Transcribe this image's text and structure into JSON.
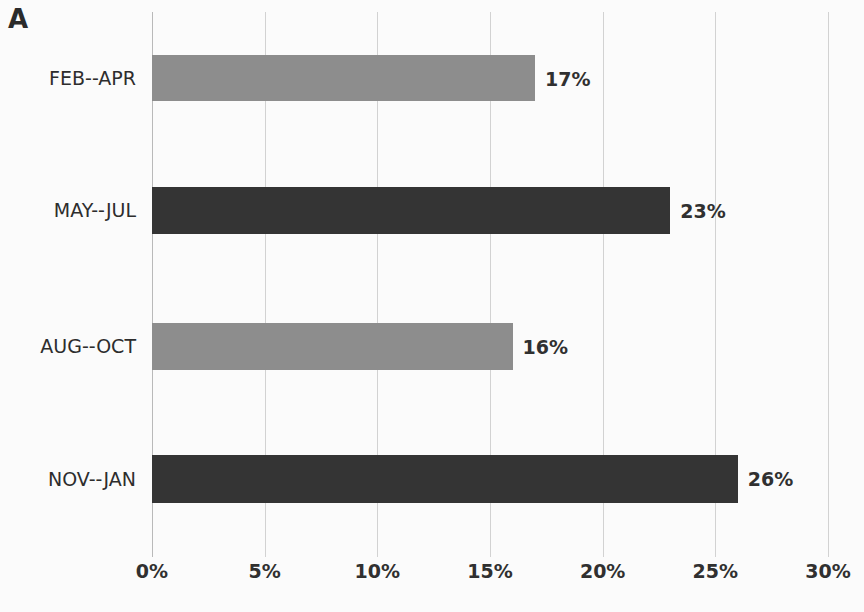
{
  "panel": {
    "letter": "A"
  },
  "chart_data": {
    "type": "bar",
    "orientation": "horizontal",
    "title": "",
    "subtitle": "",
    "xlabel": "",
    "ylabel": "",
    "categories": [
      "FEB--APR",
      "MAY--JUL",
      "AUG--OCT",
      "NOV--JAN"
    ],
    "values": [
      17,
      23,
      16,
      26
    ],
    "value_labels": [
      "17%",
      "23%",
      "16%",
      "26%"
    ],
    "bar_colors": [
      "#8d8d8d",
      "#343434",
      "#8d8d8d",
      "#343434"
    ],
    "xlim": [
      0,
      30
    ],
    "xticks": [
      0,
      5,
      10,
      15,
      20,
      25,
      30
    ],
    "xtick_labels": [
      "0%",
      "5%",
      "10%",
      "15%",
      "20%",
      "25%",
      "30%"
    ],
    "grid": true,
    "grid_axis": "x",
    "legend": "none",
    "units": "percent"
  },
  "colors": {
    "light_bar": "#8d8d8d",
    "dark_bar": "#343434",
    "gridline": "#d2d2d2",
    "text": "#2d2d2d",
    "background": "#fbfbfb"
  }
}
